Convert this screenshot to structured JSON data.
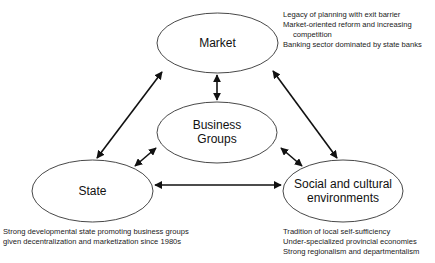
{
  "diagram": {
    "nodes": {
      "market": {
        "label": "Market"
      },
      "business_groups": {
        "label_line1": "Business",
        "label_line2": "Groups"
      },
      "state": {
        "label": "State"
      },
      "social": {
        "label_line1": "Social and cultural",
        "label_line2": "environments"
      }
    },
    "notes": {
      "market": [
        "Legacy of planning with exit barrier",
        "Market-oriented reform and increasing",
        "competition",
        "Banking sector dominated by state banks"
      ],
      "state": [
        "Strong developmental state promoting business groups",
        "given decentralization and marketization since 1980s"
      ],
      "social": [
        "Tradition of local self-sufficiency",
        "Under-specialized provincial economies",
        "Strong regionalism and departmentalism"
      ]
    },
    "edges": [
      {
        "from": "market",
        "to": "business_groups",
        "type": "bidirectional"
      },
      {
        "from": "market",
        "to": "state",
        "type": "bidirectional"
      },
      {
        "from": "market",
        "to": "social",
        "type": "bidirectional"
      },
      {
        "from": "state",
        "to": "social",
        "type": "bidirectional"
      },
      {
        "from": "business_groups",
        "to": "state",
        "type": "bidirectional"
      },
      {
        "from": "business_groups",
        "to": "social",
        "type": "bidirectional"
      }
    ],
    "colors": {
      "stroke": "#111111",
      "background": "#ffffff"
    }
  }
}
